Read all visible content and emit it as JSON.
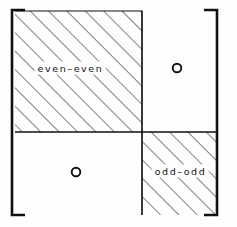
{
  "figure": {
    "kind": "block-matrix-diagram",
    "width": 237,
    "height": 227,
    "background_color": "#fefefe",
    "ink_color": "#101010"
  },
  "brackets": {
    "left": {
      "name": "left-square-bracket",
      "x": 12,
      "top": 10,
      "bottom": 215,
      "tick_length": 13,
      "stroke_width": 2.6
    },
    "right": {
      "name": "right-square-bracket",
      "x": 217,
      "top": 10,
      "bottom": 215,
      "tick_length": 13,
      "stroke_width": 2.6
    }
  },
  "blocks": [
    {
      "id": "even-even",
      "label": "even–even",
      "fill": "hatched",
      "x": 15,
      "y": 11,
      "width": 127,
      "height": 121,
      "label_x": 70,
      "label_y": 68
    },
    {
      "id": "odd-odd",
      "label": "odd–odd",
      "fill": "hatched",
      "x": 142,
      "y": 132,
      "width": 75,
      "height": 83,
      "label_x": 180,
      "label_y": 171
    }
  ],
  "zero_blocks": [
    {
      "id": "upper-right-zero",
      "label": "0",
      "glyph": "circle",
      "cx": 177,
      "cy": 68,
      "r": 4.5
    },
    {
      "id": "lower-left-zero",
      "label": "0",
      "glyph": "circle",
      "cx": 76,
      "cy": 172,
      "r": 4.5
    }
  ],
  "dividers": {
    "vertical_x": 142,
    "horizontal_y": 132,
    "stroke_width": 1.1
  },
  "hatching": {
    "angle_degrees": 45,
    "direction": "lower-left-to-upper-right",
    "spacing_px": 13,
    "stroke_width": 1.1,
    "color": "#1a1a1a"
  },
  "labels": {
    "even_even": "even–even",
    "odd_odd": "odd–odd",
    "zero_upper_right": "0",
    "zero_lower_left": "0"
  }
}
